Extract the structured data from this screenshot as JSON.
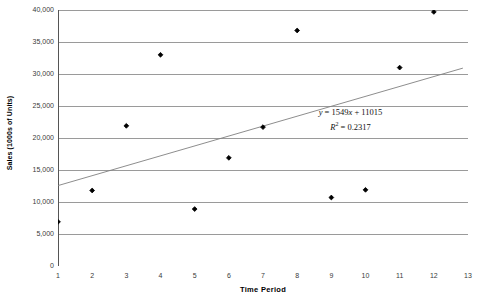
{
  "chart_data": {
    "type": "scatter",
    "title": "",
    "xlabel": "Time  Period",
    "ylabel": "Sales (1000s of Units)",
    "xlim": [
      1,
      13
    ],
    "ylim": [
      0,
      40000
    ],
    "grid": true,
    "grid_axis": "y",
    "legend": "none",
    "x": [
      1,
      2,
      3,
      4,
      5,
      6,
      7,
      8,
      9,
      10,
      11,
      12
    ],
    "values": [
      6900,
      11800,
      21900,
      33000,
      8900,
      16900,
      21700,
      36800,
      10700,
      11900,
      31000,
      39700
    ],
    "series": [
      {
        "name": "Sales",
        "marker": "filled-diamond",
        "color": "#000000",
        "points": [
          {
            "x": 1,
            "y": 6900
          },
          {
            "x": 2,
            "y": 11800
          },
          {
            "x": 3,
            "y": 21900
          },
          {
            "x": 4,
            "y": 33000
          },
          {
            "x": 5,
            "y": 8900
          },
          {
            "x": 6,
            "y": 16900
          },
          {
            "x": 7,
            "y": 21700
          },
          {
            "x": 8,
            "y": 36800
          },
          {
            "x": 9,
            "y": 10700
          },
          {
            "x": 10,
            "y": 11900
          },
          {
            "x": 11,
            "y": 31000
          },
          {
            "x": 12,
            "y": 39700
          }
        ]
      }
    ],
    "trendline": {
      "type": "linear",
      "slope": 1549,
      "intercept": 11015,
      "r_squared": 0.2317,
      "x_start": 1.0,
      "x_end": 12.85,
      "color": "#808080"
    },
    "xticks": [
      1,
      2,
      3,
      4,
      5,
      6,
      7,
      8,
      9,
      10,
      11,
      12,
      13
    ],
    "xticklabels": [
      "1",
      "2",
      "3",
      "4",
      "5",
      "6",
      "7",
      "8",
      "9",
      "10",
      "11",
      "12",
      "13"
    ],
    "yticks": [
      0,
      5000,
      10000,
      15000,
      20000,
      25000,
      30000,
      35000,
      40000
    ],
    "yticklabels": [
      "0",
      "5,000",
      "10,000",
      "15,000",
      "20,000",
      "25,000",
      "30,000",
      "35,000",
      "40,000"
    ],
    "annotations": {
      "equation": "y = 1549x + 11015",
      "equation_y": "y",
      "equation_body": " = 1549",
      "equation_x": "x",
      "equation_tail": " + 11015",
      "r_squared_label": "R",
      "r_squared_sup": "2",
      "r_squared_value": " = 0.2317"
    },
    "colors": {
      "marker": "#000000",
      "gridline": "#9a9a9a",
      "axis": "#555555",
      "trendline": "#888888",
      "background": "#ffffff",
      "tick_text": "#3a3a3a"
    }
  }
}
